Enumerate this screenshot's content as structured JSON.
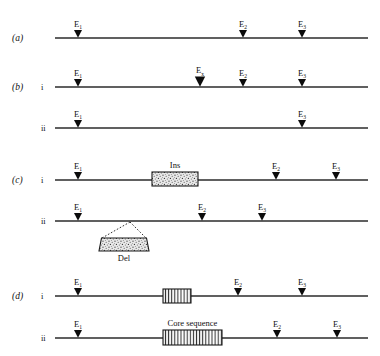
{
  "figure": {
    "line_color": "#2b2b2b",
    "marker_color": "#0c0c0c",
    "background": "#ffffff"
  },
  "labels": {
    "panel_a": "(a)",
    "panel_b": "(b)",
    "panel_c": "(c)",
    "panel_d": "(d)",
    "sub_i": "i",
    "sub_ii": "ii",
    "site_E": "E",
    "sub_1": "1",
    "sub_2": "2",
    "sub_3": "3",
    "sub_x": "x",
    "ins": "Ins",
    "del": "Del",
    "core_sequence": "Core sequence"
  },
  "rows": [
    {
      "id": "row-a",
      "panel": "(a)",
      "sub": "",
      "line": {
        "x1": 55,
        "x2": 368,
        "y": 38
      },
      "markers": [
        {
          "name": "E1",
          "base": "E",
          "sub": "1",
          "x": 78,
          "size": "normal"
        },
        {
          "name": "E2",
          "base": "E",
          "sub": "2",
          "x": 243,
          "size": "normal"
        },
        {
          "name": "E3",
          "base": "E",
          "sub": "3",
          "x": 302,
          "size": "normal"
        }
      ],
      "boxes": []
    },
    {
      "id": "row-b-i",
      "panel": "(b)",
      "sub": "i",
      "line": {
        "x1": 55,
        "x2": 368,
        "y": 87
      },
      "markers": [
        {
          "name": "E1",
          "base": "E",
          "sub": "1",
          "x": 78,
          "size": "normal"
        },
        {
          "name": "Ex",
          "base": "E",
          "sub": "x",
          "x": 200,
          "size": "large"
        },
        {
          "name": "E2",
          "base": "E",
          "sub": "2",
          "x": 243,
          "size": "normal"
        },
        {
          "name": "E3",
          "base": "E",
          "sub": "3",
          "x": 302,
          "size": "normal"
        }
      ],
      "boxes": []
    },
    {
      "id": "row-b-ii",
      "panel": "",
      "sub": "ii",
      "line": {
        "x1": 55,
        "x2": 368,
        "y": 128
      },
      "markers": [
        {
          "name": "E1",
          "base": "E",
          "sub": "1",
          "x": 78,
          "size": "normal"
        },
        {
          "name": "E3",
          "base": "E",
          "sub": "3",
          "x": 302,
          "size": "normal"
        }
      ],
      "boxes": []
    },
    {
      "id": "row-c-i",
      "panel": "(c)",
      "sub": "i",
      "line": {
        "x1": 55,
        "x2": 368,
        "y": 180
      },
      "markers": [
        {
          "name": "E1",
          "base": "E",
          "sub": "1",
          "x": 78,
          "size": "normal"
        },
        {
          "name": "E2",
          "base": "E",
          "sub": "2",
          "x": 276,
          "size": "normal"
        },
        {
          "name": "E3",
          "base": "E",
          "sub": "3",
          "x": 336,
          "size": "normal"
        }
      ],
      "boxes": [
        {
          "name": "ins-box",
          "label": "Ins",
          "x": 152,
          "y": 172,
          "w": 46,
          "h": 14,
          "fill": "stipple",
          "label_pos": "above"
        }
      ]
    },
    {
      "id": "row-c-ii",
      "panel": "",
      "sub": "ii",
      "line": {
        "x1": 55,
        "x2": 368,
        "y": 221
      },
      "markers": [
        {
          "name": "E1",
          "base": "E",
          "sub": "1",
          "x": 78,
          "size": "normal"
        },
        {
          "name": "E2",
          "base": "E",
          "sub": "2",
          "x": 202,
          "size": "normal"
        },
        {
          "name": "E3",
          "base": "E",
          "sub": "3",
          "x": 262,
          "size": "normal"
        }
      ],
      "boxes": [
        {
          "name": "del-box",
          "label": "Del",
          "x": 99,
          "y": 238,
          "w": 50,
          "h": 13,
          "fill": "stipple",
          "label_pos": "below",
          "apex_x": 130,
          "apex_y": 222
        }
      ]
    },
    {
      "id": "row-d-i",
      "panel": "(d)",
      "sub": "i",
      "line": {
        "x1": 55,
        "x2": 368,
        "y": 296
      },
      "markers": [
        {
          "name": "E1",
          "base": "E",
          "sub": "1",
          "x": 78,
          "size": "normal"
        },
        {
          "name": "E2",
          "base": "E",
          "sub": "2",
          "x": 238,
          "size": "normal"
        },
        {
          "name": "E3",
          "base": "E",
          "sub": "3",
          "x": 302,
          "size": "normal"
        }
      ],
      "boxes": [
        {
          "name": "core-box-small",
          "label": "",
          "x": 163,
          "y": 289,
          "w": 28,
          "h": 14,
          "fill": "hatch",
          "label_pos": "none"
        }
      ]
    },
    {
      "id": "row-d-ii",
      "panel": "",
      "sub": "ii",
      "line": {
        "x1": 55,
        "x2": 368,
        "y": 338
      },
      "markers": [
        {
          "name": "E1",
          "base": "E",
          "sub": "1",
          "x": 78,
          "size": "normal"
        },
        {
          "name": "E2",
          "base": "E",
          "sub": "2",
          "x": 277,
          "size": "normal"
        },
        {
          "name": "E3",
          "base": "E",
          "sub": "3",
          "x": 337,
          "size": "normal"
        }
      ],
      "boxes": [
        {
          "name": "core-box-large",
          "label": "Core sequence",
          "x": 163,
          "y": 330,
          "w": 59,
          "h": 15,
          "fill": "hatch",
          "label_pos": "above"
        }
      ]
    }
  ]
}
